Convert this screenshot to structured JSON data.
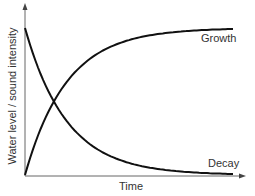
{
  "chart_data": {
    "type": "line",
    "title": "",
    "xlabel": "Time",
    "ylabel": "Water level / sound intensity",
    "grid": false,
    "legend": "inline labels",
    "x": [
      0,
      0.1,
      0.2,
      0.3,
      0.4,
      0.5,
      0.6,
      0.7,
      0.8,
      0.9,
      1.0
    ],
    "series": [
      {
        "name": "Growth",
        "values": [
          0,
          0.38,
          0.62,
          0.76,
          0.85,
          0.91,
          0.945,
          0.965,
          0.98,
          0.99,
          0.995
        ]
      },
      {
        "name": "Decay",
        "values": [
          1.0,
          0.62,
          0.38,
          0.24,
          0.15,
          0.09,
          0.055,
          0.035,
          0.02,
          0.01,
          0.005
        ]
      }
    ],
    "annotations": [
      "Growth",
      "Decay"
    ],
    "xlim": [
      0,
      1
    ],
    "ylim": [
      0,
      1
    ]
  },
  "labels": {
    "growth": "Growth",
    "decay": "Decay",
    "x_axis": "Time",
    "y_axis": "Water level / sound intensity"
  },
  "colors": {
    "curve": "#111111",
    "axis": "#555555",
    "text": "#333333"
  }
}
